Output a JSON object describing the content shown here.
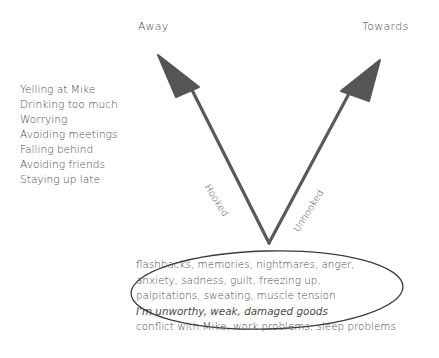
{
  "diagram": {
    "title_left": "Away",
    "title_right": "Towards",
    "left_arm_label": "Hooked",
    "right_arm_label": "Unhooked",
    "away_behaviors": [
      "Yelling at Mike",
      "Drinking too much",
      "Worrying",
      "Avoiding meetings",
      "Falling behind",
      "Avoiding friends",
      "Staying up late"
    ],
    "inner_experiences": [
      "flashbacks, memories, nightmares, anger,",
      "anxiety, sadness, guilt, freezing up,",
      "palpitations, sweating, muscle tension",
      "I'm unworthy, weak, damaged goods",
      "conflict with Mike, work problems, sleep problems"
    ],
    "colors": {
      "arrow": "#5a5a5a",
      "text": "#4a4a4a",
      "ellipse": "#3c3c3c"
    }
  }
}
